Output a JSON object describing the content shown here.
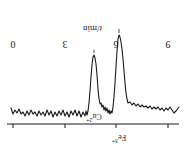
{
  "figure": {
    "orientation": "rotated-180",
    "background": "#ffffff",
    "trace_color": "#1a1a1a"
  },
  "axis": {
    "title_symbol": "t",
    "title_sep": "/",
    "title_unit": "min",
    "title_full": "t/min",
    "tick_labels": [
      "9",
      "6",
      "3",
      "0"
    ],
    "tick_values": [
      9,
      6,
      3,
      0
    ],
    "tick_x_px": [
      17,
      69,
      120,
      172
    ],
    "line_y_px": 39
  },
  "peaks": [
    {
      "label_element": "Fe",
      "label_charge": "3+",
      "label_full": "Fe3+",
      "retention_time": 6.3,
      "x_px": 66,
      "depth_px": 128,
      "label_x_px": 66,
      "label_y_px": 19
    },
    {
      "label_element": "Cu",
      "label_charge": "2+",
      "label_full": "Cu2+",
      "retention_time": 4.9,
      "x_px": 91,
      "depth_px": 108,
      "label_x_px": 91,
      "label_y_px": 40
    }
  ],
  "chart_data": {
    "type": "line",
    "title": "",
    "xlabel": "t/min",
    "ylabel": "",
    "xlim": [
      9,
      0
    ],
    "grid": false,
    "legend": null,
    "annotations": [
      "Fe3+",
      "Cu2+"
    ],
    "x_ticks": [
      9,
      6,
      3,
      0
    ],
    "series": [
      {
        "name": "detector signal",
        "note": "negative (downward) peaks; baseline noisy",
        "points_px": [
          [
            6,
            56
          ],
          [
            9,
            52
          ],
          [
            11,
            50
          ],
          [
            13,
            53
          ],
          [
            15,
            56
          ],
          [
            17,
            53
          ],
          [
            19,
            55
          ],
          [
            21,
            52
          ],
          [
            23,
            55
          ],
          [
            25,
            53
          ],
          [
            27,
            56
          ],
          [
            29,
            54
          ],
          [
            31,
            56
          ],
          [
            33,
            54
          ],
          [
            35,
            57
          ],
          [
            37,
            55
          ],
          [
            39,
            57
          ],
          [
            41,
            56
          ],
          [
            43,
            58
          ],
          [
            45,
            56
          ],
          [
            47,
            59
          ],
          [
            49,
            57
          ],
          [
            51,
            60
          ],
          [
            53,
            58
          ],
          [
            55,
            61
          ],
          [
            57,
            60
          ],
          [
            58,
            64
          ],
          [
            59,
            70
          ],
          [
            60,
            80
          ],
          [
            61,
            92
          ],
          [
            62,
            104
          ],
          [
            63,
            114
          ],
          [
            64,
            121
          ],
          [
            65,
            126
          ],
          [
            66,
            128
          ],
          [
            67,
            124
          ],
          [
            68,
            112
          ],
          [
            69,
            96
          ],
          [
            70,
            80
          ],
          [
            71,
            66
          ],
          [
            72,
            56
          ],
          [
            73,
            50
          ],
          [
            74,
            52
          ],
          [
            75,
            49
          ],
          [
            76,
            53
          ],
          [
            77,
            50
          ],
          [
            78,
            55
          ],
          [
            79,
            52
          ],
          [
            80,
            56
          ],
          [
            81,
            53
          ],
          [
            82,
            58
          ],
          [
            83,
            56
          ],
          [
            84,
            60
          ],
          [
            85,
            59
          ],
          [
            86,
            64
          ],
          [
            87,
            74
          ],
          [
            88,
            88
          ],
          [
            89,
            99
          ],
          [
            90,
            105
          ],
          [
            91,
            108
          ],
          [
            92,
            106
          ],
          [
            93,
            98
          ],
          [
            94,
            86
          ],
          [
            95,
            72
          ],
          [
            96,
            60
          ],
          [
            97,
            52
          ],
          [
            98,
            48
          ],
          [
            99,
            52
          ],
          [
            100,
            47
          ],
          [
            102,
            51
          ],
          [
            104,
            46
          ],
          [
            106,
            52
          ],
          [
            108,
            47
          ],
          [
            110,
            53
          ],
          [
            112,
            48
          ],
          [
            114,
            52
          ],
          [
            116,
            46
          ],
          [
            118,
            51
          ],
          [
            120,
            47
          ],
          [
            122,
            53
          ],
          [
            124,
            48
          ],
          [
            126,
            52
          ],
          [
            128,
            47
          ],
          [
            130,
            51
          ],
          [
            132,
            46
          ],
          [
            134,
            52
          ],
          [
            136,
            48
          ],
          [
            138,
            53
          ],
          [
            140,
            47
          ],
          [
            142,
            51
          ],
          [
            144,
            48
          ],
          [
            146,
            52
          ],
          [
            148,
            47
          ],
          [
            150,
            51
          ],
          [
            152,
            49
          ],
          [
            154,
            53
          ],
          [
            156,
            48
          ],
          [
            158,
            52
          ],
          [
            160,
            47
          ],
          [
            162,
            51
          ],
          [
            164,
            49
          ],
          [
            166,
            54
          ],
          [
            168,
            50
          ],
          [
            170,
            53
          ],
          [
            172,
            49
          ],
          [
            174,
            55
          ]
        ]
      }
    ]
  }
}
